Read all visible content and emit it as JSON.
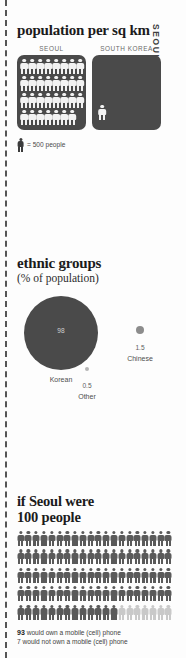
{
  "side_label": "SEOUL TODAY",
  "colors": {
    "dark": "#4a4a4a",
    "figure_light": "#f2f2f2",
    "grid_dark": "#5a5a5a",
    "grid_light": "#c9c9c9",
    "text": "#1b1b1b"
  },
  "population": {
    "title": "population per sq km",
    "col_seoul_label": "SEOUL",
    "col_korea_label": "SOUTH KOREA",
    "seoul_figure_count": 31,
    "korea_figure_count": 1,
    "legend_text": "= 500 people"
  },
  "ethnic": {
    "title": "ethnic groups",
    "subtitle": "(% of population)",
    "groups": [
      {
        "label": "Korean",
        "value": "98"
      },
      {
        "label": "Chinese",
        "value": "1.5"
      },
      {
        "label": "Other",
        "value": "0.5"
      }
    ]
  },
  "hundred": {
    "title_line1": "if Seoul were",
    "title_line2": "100 people",
    "total_figures": 100,
    "own_phone": 93,
    "not_own_phone": 7,
    "note_own_bold": "93",
    "note_own_rest": " would own a mobile (cell) phone",
    "note_not_own": "7 would not own a mobile (cell) phone"
  },
  "chart_data": [
    {
      "type": "pictogram",
      "title": "population per sq km",
      "categories": [
        "SEOUL",
        "SOUTH KOREA"
      ],
      "values": [
        15500,
        500
      ],
      "unit_per_icon": 500,
      "icons": [
        31,
        1
      ],
      "legend": "= 500 people",
      "ylabel": "",
      "xlabel": ""
    },
    {
      "type": "bubble",
      "title": "ethnic groups",
      "subtitle": "(% of population)",
      "categories": [
        "Korean",
        "Chinese",
        "Other"
      ],
      "values": [
        98,
        1.5,
        0.5
      ],
      "ylabel": "% of population",
      "xlabel": "",
      "grid": false,
      "legend_position": "labels-under-bubbles"
    },
    {
      "type": "pictogram",
      "title": "if Seoul were 100 people",
      "categories": [
        "would own a mobile (cell) phone",
        "would not own a mobile (cell) phone"
      ],
      "values": [
        93,
        7
      ],
      "total": 100,
      "grid_columns": 20,
      "grid_rows": 5,
      "annotations": [
        "93 would own a mobile (cell) phone",
        "7 would not own a mobile (cell) phone"
      ]
    }
  ]
}
